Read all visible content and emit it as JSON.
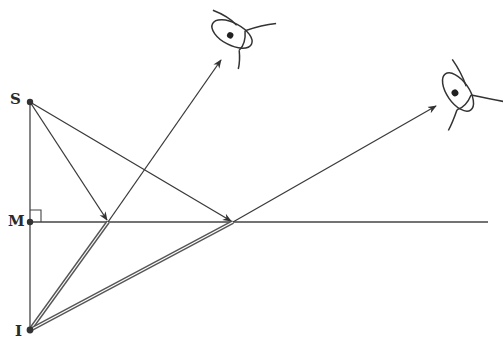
{
  "diagram": {
    "type": "plane-mirror-reflection",
    "labels": {
      "source": "S",
      "foot": "M",
      "image": "I"
    },
    "points": {
      "S": [
        30,
        102
      ],
      "M": [
        30,
        222
      ],
      "I": [
        30,
        330
      ],
      "R1": [
        108,
        222
      ],
      "R2": [
        233,
        222
      ]
    },
    "mirror": {
      "from": [
        30,
        222
      ],
      "to": [
        488,
        222
      ]
    },
    "incident_rays": [
      {
        "from": "S",
        "to": "R1"
      },
      {
        "from": "S",
        "to": "R2"
      }
    ],
    "reflected_rays": [
      {
        "from": "R1",
        "to": [
          221,
          60
        ]
      },
      {
        "from": "R2",
        "to": [
          436,
          106
        ]
      }
    ],
    "virtual_rays": [
      {
        "from": "I",
        "to": "R1"
      },
      {
        "from": "I",
        "to": "R2"
      }
    ],
    "observers": [
      {
        "name": "eye-1",
        "center": [
          232,
          34
        ]
      },
      {
        "name": "eye-2",
        "center": [
          458,
          92
        ]
      }
    ],
    "colors": {
      "line": "#3a3a3a",
      "background": "#ffffff"
    }
  }
}
